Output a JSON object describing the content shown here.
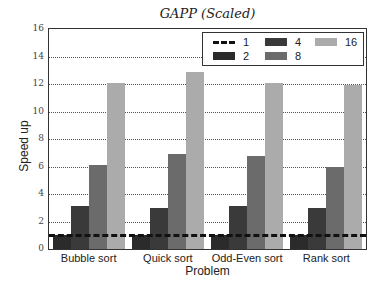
{
  "chart_data": {
    "type": "bar",
    "title": "GAPP (Scaled)",
    "xlabel": "Problem",
    "ylabel": "Speed up",
    "ylim": [
      0,
      16
    ],
    "yticks": [
      0,
      2,
      4,
      6,
      8,
      10,
      12,
      14,
      16
    ],
    "grid": "horizontal dotted",
    "legend_position": "upper right",
    "categories": [
      "Bubble sort",
      "Quick sort",
      "Odd-Even sort",
      "Rank sort"
    ],
    "baseline": {
      "name": "1",
      "value": 1,
      "style": "dashed"
    },
    "series": [
      {
        "name": "2",
        "color": "#2b2b2b",
        "values": [
          1.0,
          1.0,
          1.0,
          1.0
        ]
      },
      {
        "name": "4",
        "color": "#3a3a3a",
        "values": [
          3.1,
          3.0,
          3.1,
          3.0
        ]
      },
      {
        "name": "8",
        "color": "#6b6b6b",
        "values": [
          6.1,
          6.9,
          6.8,
          6.0
        ]
      },
      {
        "name": "16",
        "color": "#ababab",
        "values": [
          12.1,
          12.9,
          12.1,
          11.9
        ]
      }
    ]
  },
  "legend": {
    "items": [
      {
        "label": "1",
        "style": "dashed"
      },
      {
        "label": "4",
        "color": "#3a3a3a"
      },
      {
        "label": "16",
        "color": "#ababab"
      },
      {
        "label": "2",
        "color": "#2b2b2b"
      },
      {
        "label": "8",
        "color": "#6b6b6b"
      }
    ]
  }
}
